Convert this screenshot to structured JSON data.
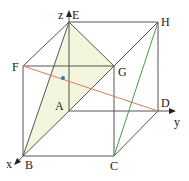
{
  "diagram": {
    "type": "cube-with-axes",
    "vertices": {
      "E": {
        "label": "E",
        "x": 69,
        "y": 22
      },
      "H": {
        "label": "H",
        "x": 158,
        "y": 22
      },
      "F": {
        "label": "F",
        "x": 23,
        "y": 66
      },
      "G": {
        "label": "G",
        "x": 114,
        "y": 66
      },
      "A": {
        "label": "A",
        "x": 69,
        "y": 111
      },
      "D": {
        "label": "D",
        "x": 158,
        "y": 111
      },
      "B": {
        "label": "B",
        "x": 23,
        "y": 156
      },
      "C": {
        "label": "C",
        "x": 114,
        "y": 156
      }
    },
    "axes": {
      "x": {
        "label": "x"
      },
      "y": {
        "label": "y"
      },
      "z": {
        "label": "z"
      }
    },
    "shaded_triangle": [
      "E",
      "B",
      "G"
    ],
    "highlighted_segments": [
      {
        "from": "F",
        "to": "D",
        "color": "#e07a5f"
      },
      {
        "from": "C",
        "to": "H",
        "color": "#4a9a4a"
      }
    ],
    "marked_point": {
      "x": 63,
      "y": 78,
      "color": "#2a7fb8"
    },
    "colors": {
      "edge": "#555555",
      "shade": "#f3f5dc",
      "red_line": "#e07a5f",
      "green_line": "#4a9a4a",
      "dot": "#2a7fb8"
    }
  }
}
